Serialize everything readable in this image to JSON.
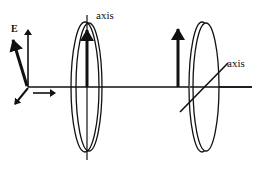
{
  "diagram": {
    "colors": {
      "stroke": "#111111",
      "background": "#ffffff"
    },
    "labels": {
      "field": "E",
      "polarizer1_axis": "axis",
      "polarizer2_axis": "axis"
    },
    "elements": [
      {
        "id": "coordinate-axes",
        "description": "E-field vector with orthogonal axes and propagation arrow"
      },
      {
        "id": "polarizer-1",
        "description": "Vertical transmission axis, vertical E arrow passes"
      },
      {
        "id": "polarizer-2",
        "description": "Tilted (diagonal) transmission axis"
      },
      {
        "id": "beam-line",
        "description": "Horizontal propagation line"
      }
    ]
  }
}
